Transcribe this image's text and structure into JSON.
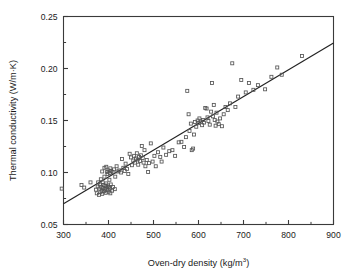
{
  "figure": {
    "background_color": "#ffffff",
    "frame_color": "#3a3a3a",
    "marker_color": "#555555",
    "line_color": "#222222"
  },
  "chart_data": {
    "type": "scatter",
    "title": "",
    "xlabel": "Oven-dry density (kg/m",
    "xlabel_sup": "3",
    "xlabel_tail": ")",
    "ylabel": "Thermal conductivity (W/m·K)",
    "xlim": [
      300,
      900
    ],
    "ylim": [
      0.05,
      0.25
    ],
    "xticks": [
      300,
      400,
      500,
      600,
      700,
      800,
      900
    ],
    "xtick_labels": [
      "300",
      "400",
      "500",
      "600",
      "700",
      "800",
      "900"
    ],
    "xticks_minor": [
      350,
      450,
      550,
      650,
      750,
      850
    ],
    "yticks": [
      0.05,
      0.1,
      0.15,
      0.2,
      0.25
    ],
    "ytick_labels": [
      "0.05",
      "0.10",
      "0.15",
      "0.20",
      "0.25"
    ],
    "yticks_minor": [
      0.075,
      0.125,
      0.175,
      0.225
    ],
    "grid": false,
    "legend": null,
    "marker": "open-square",
    "marker_size": 3,
    "fit_line": {
      "label": "linear regression",
      "x": [
        300,
        900
      ],
      "y": [
        0.07,
        0.2245
      ],
      "slope": 0.0002575,
      "intercept": -0.00725
    },
    "points": [
      [
        296,
        0.0845
      ],
      [
        340,
        0.088
      ],
      [
        346,
        0.0855
      ],
      [
        360,
        0.0905
      ],
      [
        372,
        0.0835
      ],
      [
        374,
        0.08
      ],
      [
        376,
        0.0865
      ],
      [
        377,
        0.0905
      ],
      [
        379,
        0.0785
      ],
      [
        380,
        0.0845
      ],
      [
        381,
        0.0885
      ],
      [
        382,
        0.081
      ],
      [
        383,
        0.0935
      ],
      [
        384,
        0.086
      ],
      [
        385,
        0.0825
      ],
      [
        386,
        0.0795
      ],
      [
        387,
        0.0905
      ],
      [
        388,
        0.085
      ],
      [
        389,
        0.088
      ],
      [
        390,
        0.082
      ],
      [
        391,
        0.096
      ],
      [
        392,
        0.084
      ],
      [
        393,
        0.087
      ],
      [
        394,
        0.0805
      ],
      [
        395,
        0.0895
      ],
      [
        396,
        0.0855
      ],
      [
        397,
        0.1005
      ],
      [
        398,
        0.083
      ],
      [
        399,
        0.0875
      ],
      [
        400,
        0.0815
      ],
      [
        401,
        0.086
      ],
      [
        402,
        0.093
      ],
      [
        403,
        0.0845
      ],
      [
        404,
        0.08
      ],
      [
        405,
        0.0885
      ],
      [
        406,
        0.1015
      ],
      [
        408,
        0.0825
      ],
      [
        410,
        0.086
      ],
      [
        412,
        0.103
      ],
      [
        414,
        0.084
      ],
      [
        395,
        0.1055
      ],
      [
        400,
        0.102
      ],
      [
        404,
        0.104
      ],
      [
        409,
        0.1005
      ],
      [
        386,
        0.101
      ],
      [
        391,
        0.1045
      ],
      [
        398,
        0.0985
      ],
      [
        403,
        0.0995
      ],
      [
        415,
        0.096
      ],
      [
        418,
        0.106
      ],
      [
        420,
        0.101
      ],
      [
        424,
        0.102
      ],
      [
        428,
        0.1
      ],
      [
        430,
        0.113
      ],
      [
        433,
        0.1045
      ],
      [
        436,
        0.1015
      ],
      [
        438,
        0.1085
      ],
      [
        441,
        0.1035
      ],
      [
        444,
        0.0985
      ],
      [
        447,
        0.118
      ],
      [
        450,
        0.1145
      ],
      [
        452,
        0.107
      ],
      [
        455,
        0.1115
      ],
      [
        457,
        0.116
      ],
      [
        459,
        0.1095
      ],
      [
        461,
        0.1135
      ],
      [
        463,
        0.1185
      ],
      [
        465,
        0.1125
      ],
      [
        466,
        0.1075
      ],
      [
        468,
        0.115
      ],
      [
        470,
        0.111
      ],
      [
        472,
        0.1165
      ],
      [
        474,
        0.1255
      ],
      [
        476,
        0.114
      ],
      [
        478,
        0.1095
      ],
      [
        480,
        0.1215
      ],
      [
        482,
        0.106
      ],
      [
        485,
        0.112
      ],
      [
        488,
        0.1005
      ],
      [
        490,
        0.109
      ],
      [
        494,
        0.128
      ],
      [
        498,
        0.1105
      ],
      [
        502,
        0.116
      ],
      [
        505,
        0.106
      ],
      [
        510,
        0.1195
      ],
      [
        515,
        0.115
      ],
      [
        518,
        0.1105
      ],
      [
        522,
        0.124
      ],
      [
        528,
        0.117
      ],
      [
        535,
        0.1205
      ],
      [
        542,
        0.1215
      ],
      [
        548,
        0.116
      ],
      [
        556,
        0.129
      ],
      [
        562,
        0.1295
      ],
      [
        568,
        0.1245
      ],
      [
        572,
        0.134
      ],
      [
        575,
        0.1785
      ],
      [
        578,
        0.156
      ],
      [
        580,
        0.14
      ],
      [
        583,
        0.147
      ],
      [
        585,
        0.1215
      ],
      [
        588,
        0.123
      ],
      [
        590,
        0.1365
      ],
      [
        592,
        0.1485
      ],
      [
        595,
        0.144
      ],
      [
        598,
        0.15
      ],
      [
        600,
        0.1475
      ],
      [
        602,
        0.152
      ],
      [
        605,
        0.149
      ],
      [
        608,
        0.1455
      ],
      [
        610,
        0.1505
      ],
      [
        612,
        0.148
      ],
      [
        615,
        0.162
      ],
      [
        618,
        0.1615
      ],
      [
        620,
        0.153
      ],
      [
        622,
        0.1495
      ],
      [
        625,
        0.146
      ],
      [
        628,
        0.1585
      ],
      [
        630,
        0.186
      ],
      [
        632,
        0.154
      ],
      [
        634,
        0.165
      ],
      [
        636,
        0.1505
      ],
      [
        638,
        0.145
      ],
      [
        640,
        0.1575
      ],
      [
        642,
        0.149
      ],
      [
        645,
        0.1465
      ],
      [
        648,
        0.152
      ],
      [
        652,
        0.1445
      ],
      [
        656,
        0.156
      ],
      [
        660,
        0.163
      ],
      [
        665,
        0.16
      ],
      [
        670,
        0.1665
      ],
      [
        675,
        0.205
      ],
      [
        682,
        0.163
      ],
      [
        688,
        0.173
      ],
      [
        695,
        0.189
      ],
      [
        705,
        0.177
      ],
      [
        712,
        0.186
      ],
      [
        722,
        0.1795
      ],
      [
        732,
        0.184
      ],
      [
        748,
        0.18
      ],
      [
        762,
        0.192
      ],
      [
        775,
        0.201
      ],
      [
        785,
        0.194
      ],
      [
        830,
        0.212
      ]
    ]
  }
}
